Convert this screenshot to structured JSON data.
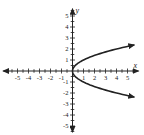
{
  "chart_data": {
    "type": "line",
    "title": "",
    "equation": "x = y^2",
    "xlabel": "x",
    "ylabel": "y",
    "xlim": [
      -5.5,
      5.5
    ],
    "ylim": [
      -5.5,
      5.5
    ],
    "x_ticks": [
      -5,
      -4,
      -3,
      -2,
      -1,
      1,
      2,
      3,
      4,
      5
    ],
    "y_ticks": [
      -5,
      -4,
      -3,
      -2,
      -1,
      1,
      2,
      3,
      4,
      5
    ],
    "x_tick_labels": [
      "-5",
      "-4",
      "-3",
      "-2",
      "-1",
      "1",
      "2",
      "3",
      "4",
      "5"
    ],
    "y_tick_labels": [
      "-5",
      "-4",
      "-3",
      "-2",
      "-1",
      "1",
      "2",
      "3",
      "4",
      "5"
    ],
    "minor_tick_step": 0.5,
    "grid": false,
    "legend": null,
    "series": [
      {
        "name": "x = y^2",
        "arrows_at_ends": true,
        "points": [
          {
            "x": 5.6,
            "y": 2.37
          },
          {
            "x": 4,
            "y": 2
          },
          {
            "x": 2.25,
            "y": 1.5
          },
          {
            "x": 1,
            "y": 1
          },
          {
            "x": 0.25,
            "y": 0.5
          },
          {
            "x": 0,
            "y": 0
          },
          {
            "x": 0.25,
            "y": -0.5
          },
          {
            "x": 1,
            "y": -1
          },
          {
            "x": 2.25,
            "y": -1.5
          },
          {
            "x": 4,
            "y": -2
          },
          {
            "x": 5.6,
            "y": -2.37
          }
        ]
      }
    ]
  },
  "labels": {
    "x_axis": "x",
    "y_axis": "y"
  }
}
